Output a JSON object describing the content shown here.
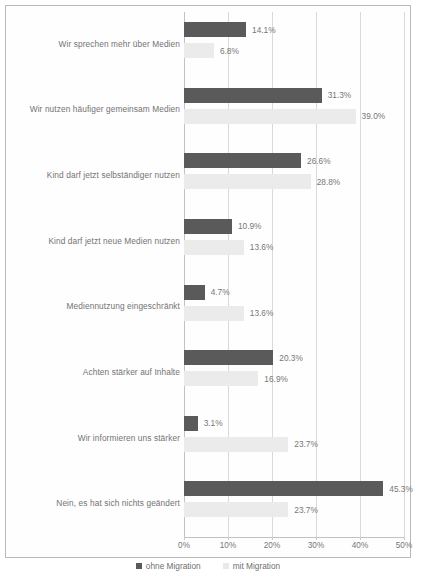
{
  "chart_data": {
    "type": "bar",
    "orientation": "horizontal",
    "title": "",
    "xlabel": "",
    "ylabel": "",
    "xlim": [
      0,
      50
    ],
    "grid": true,
    "legend_position": "bottom",
    "tick_labels": [
      "0%",
      "10%",
      "20%",
      "30%",
      "40%",
      "50%"
    ],
    "tick_values": [
      0,
      10,
      20,
      30,
      40,
      50
    ],
    "categories": [
      "Wir sprechen mehr über Medien",
      "Wir nutzen häufiger gemeinsam Medien",
      "Kind darf jetzt selbständiger nutzen",
      "Kind darf jetzt neue Medien nutzen",
      "Mediennutzung eingeschränkt",
      "Achten stärker auf Inhalte",
      "Wir informieren uns stärker",
      "Nein, es hat sich nichts geändert"
    ],
    "series": [
      {
        "name": "ohne Migration",
        "color": "#5a5a5a",
        "values": [
          14.1,
          31.3,
          26.6,
          10.9,
          4.7,
          20.3,
          3.1,
          45.3
        ],
        "labels": [
          "14.1%",
          "31.3%",
          "26.6%",
          "10.9%",
          "4.7%",
          "20.3%",
          "3.1%",
          "45.3%"
        ]
      },
      {
        "name": "mit Migration",
        "color": "#ebebeb",
        "values": [
          6.8,
          39.0,
          28.8,
          13.6,
          13.6,
          16.9,
          23.7,
          23.7
        ],
        "labels": [
          "6.8%",
          "39.0%",
          "28.8%",
          "13.6%",
          "13.6%",
          "16.9%",
          "23.7%",
          "23.7%"
        ]
      }
    ]
  },
  "legend": {
    "items": [
      {
        "label": "ohne Migration",
        "swatch": "dark"
      },
      {
        "label": "mit Migration",
        "swatch": "light"
      }
    ]
  },
  "caption_remnant": ""
}
